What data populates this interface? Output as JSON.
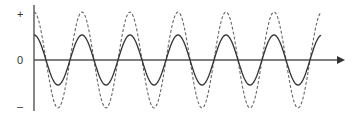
{
  "chart_data": {
    "type": "line",
    "title": "",
    "xlabel": "",
    "ylabel": "",
    "y_tick_labels": [
      "+",
      "0",
      "–"
    ],
    "grid": false,
    "legend": [],
    "series": [
      {
        "name": "large-amplitude wave",
        "style": "dashed",
        "amplitude": 48,
        "period_px": 48,
        "phase": "starts at peak"
      },
      {
        "name": "small-amplitude wave",
        "style": "solid",
        "amplitude": 25,
        "period_px": 48,
        "phase": "starts at peak"
      }
    ],
    "cycles_shown": 6,
    "x_axis_arrow": true,
    "colors": {
      "axis": "#555555",
      "solid": "#333333",
      "dashed": "#666666"
    }
  },
  "labels": {
    "plus": "+",
    "zero": "0",
    "minus": "–"
  }
}
